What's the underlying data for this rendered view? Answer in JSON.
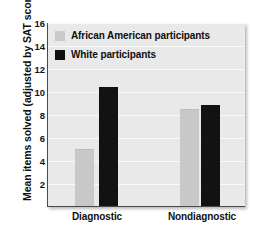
{
  "chart_data": {
    "type": "bar",
    "title": "",
    "xlabel": "",
    "ylabel": "Mean items solved (adjusted by SAT score)",
    "categories": [
      "Diagnostic",
      "Nondiagnostic"
    ],
    "series": [
      {
        "name": "African American participants",
        "color": "#c8c8c8",
        "values": [
          5.0,
          8.4
        ]
      },
      {
        "name": "White participants",
        "color": "#121212",
        "values": [
          10.4,
          8.9
        ]
      }
    ],
    "ylim": [
      0,
      16
    ],
    "ytick_values": [
      16,
      14,
      12,
      10,
      8,
      6,
      4,
      2
    ],
    "ytick_labels": [
      "16",
      "14",
      "12",
      "10",
      "8",
      "6",
      "4",
      "2"
    ],
    "grid": true,
    "legend_position": "top-left",
    "plot_background": "#e9e9e9",
    "gridline_color": "#fafafa"
  },
  "legend": {
    "items": [
      {
        "label": "African American participants",
        "swatch": "legend-swatch-gray"
      },
      {
        "label": "White participants",
        "swatch": "legend-swatch-black"
      }
    ]
  }
}
